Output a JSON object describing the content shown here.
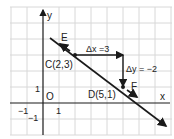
{
  "diagram": {
    "axes": {
      "x_label": "x",
      "y_label": "y",
      "origin_label": "O"
    },
    "ticks": {
      "x_pos": "1",
      "x_neg": "−1",
      "y_pos": "1",
      "y_neg": "−1"
    },
    "points": {
      "C": {
        "label": "C(2,3)",
        "x": 2,
        "y": 3
      },
      "D": {
        "label": "D(5,1)",
        "x": 5,
        "y": 1
      },
      "E": {
        "label": "E"
      },
      "F": {
        "label": "F"
      }
    },
    "annotations": {
      "dx": "Δx =3",
      "dy": "Δy = −2"
    },
    "colors": {
      "grid": "#d8d8d8",
      "ink": "#1a1a1a"
    }
  }
}
